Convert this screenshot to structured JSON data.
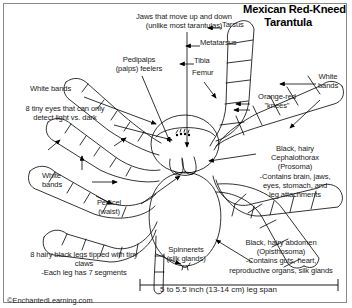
{
  "title": {
    "line1": "Mexican Red-Kneed",
    "line2": "Tarantula"
  },
  "labels": {
    "jaws": "Jaws that move up and down\n(unlike most tarantulas)",
    "pedipalps": "Pedipalps\n(palps) feelers",
    "white_bands_top_left": "White bands",
    "eyes": "8 tiny eyes that can only\ndetect light vs. dark",
    "white_bands_left": "White\nbands",
    "pedicel": "Pedicel\n(waist)",
    "legs": "8 hairy black legs tipped with tiny\nclaws\n-Each leg has 7 segments",
    "spinnerets": "Spinnerets\n(silk glands)",
    "tarsus": "Tarsus",
    "metatarsus": "Metatarsus",
    "tibia": "Tibia",
    "femur": "Femur",
    "orange_red_knees": "Orange-red\n\"knees\"",
    "white_bands_right": "White\nbands",
    "cephalothorax": "Black, hairy\nCephalothorax\n(Prosoma)\n-Contains brain, jaws,\neyes, stomach, and\nleg attachments",
    "abdomen": "Black, hairy abdomen\n(Opisthosoma)\n-Contains guts, heart,\nreproductive organs, silk glands"
  },
  "scale": {
    "caption": "5 to 5.5 inch (13-14 cm) leg span"
  },
  "credit": "©EnchantedLearning.com",
  "colors": {
    "ink": "#000000",
    "border": "#8a8a8a",
    "background": "#ffffff"
  }
}
